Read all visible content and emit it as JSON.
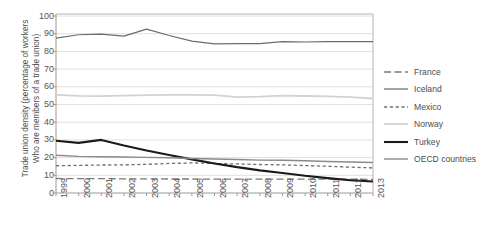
{
  "chart_data": {
    "type": "line",
    "title": "",
    "xlabel": "",
    "ylabel": "Trade union density (percentage of workers Who are members of a trade union)",
    "ylabel_line1": "Trade union density (percentage of workers",
    "ylabel_line2": "Who are members of a trade union)",
    "categories": [
      "1999",
      "2000",
      "2001",
      "2002",
      "2003",
      "2004",
      "2005",
      "2006",
      "2007",
      "2008",
      "2009",
      "2010",
      "2011",
      "2012",
      "2013"
    ],
    "x": [
      1999,
      2000,
      2001,
      2002,
      2003,
      2004,
      2005,
      2006,
      2007,
      2008,
      2009,
      2010,
      2011,
      2012,
      2013
    ],
    "ylim": [
      0,
      100
    ],
    "yticks": [
      0,
      10,
      20,
      30,
      40,
      50,
      60,
      70,
      80,
      90,
      100
    ],
    "grid": "horizontal",
    "legend_position": "right",
    "series": [
      {
        "name": "France",
        "style": "long-dash",
        "color": "#7a7a7a",
        "width": 1.3,
        "values": [
          8.2,
          8.1,
          8.1,
          8.0,
          8.0,
          7.9,
          7.9,
          7.8,
          7.8,
          7.8,
          7.8,
          7.8,
          7.8,
          7.8,
          7.7
        ]
      },
      {
        "name": "Iceland",
        "style": "solid",
        "color": "#6b6b6b",
        "width": 1.2,
        "values": [
          87.5,
          89.4,
          89.8,
          88.6,
          92.6,
          89.0,
          85.8,
          84.3,
          84.4,
          84.4,
          85.5,
          85.3,
          85.5,
          85.5,
          85.5
        ]
      },
      {
        "name": "Mexico",
        "style": "short-dash",
        "color": "#6f6f6f",
        "width": 1.3,
        "values": [
          15.4,
          15.6,
          15.8,
          15.9,
          16.2,
          16.7,
          17.0,
          16.7,
          16.4,
          16.1,
          15.9,
          15.5,
          15.1,
          14.6,
          14.2
        ]
      },
      {
        "name": "Norway",
        "style": "solid",
        "color": "#d2d2d2",
        "width": 1.8,
        "values": [
          55.4,
          54.9,
          54.7,
          55.0,
          55.3,
          55.4,
          55.4,
          55.3,
          54.2,
          54.4,
          55.0,
          54.8,
          54.6,
          54.2,
          53.4
        ]
      },
      {
        "name": "Turkey",
        "style": "solid",
        "color": "#1a1a1a",
        "width": 2.1,
        "values": [
          29.5,
          28.3,
          30.0,
          26.8,
          24.0,
          21.5,
          19.0,
          16.7,
          14.6,
          12.8,
          11.3,
          9.7,
          8.4,
          7.2,
          6.5
        ]
      },
      {
        "name": "OECD countries",
        "style": "solid",
        "color": "#8a8a8a",
        "width": 1.4,
        "values": [
          21.3,
          20.7,
          20.5,
          20.3,
          20.1,
          19.9,
          19.5,
          19.2,
          18.9,
          18.6,
          18.5,
          18.2,
          17.8,
          17.5,
          17.2
        ]
      }
    ]
  },
  "legend": {
    "items": [
      {
        "label": "France"
      },
      {
        "label": "Iceland"
      },
      {
        "label": "Mexico"
      },
      {
        "label": "Norway"
      },
      {
        "label": "Turkey"
      },
      {
        "label": "OECD countries"
      }
    ]
  }
}
